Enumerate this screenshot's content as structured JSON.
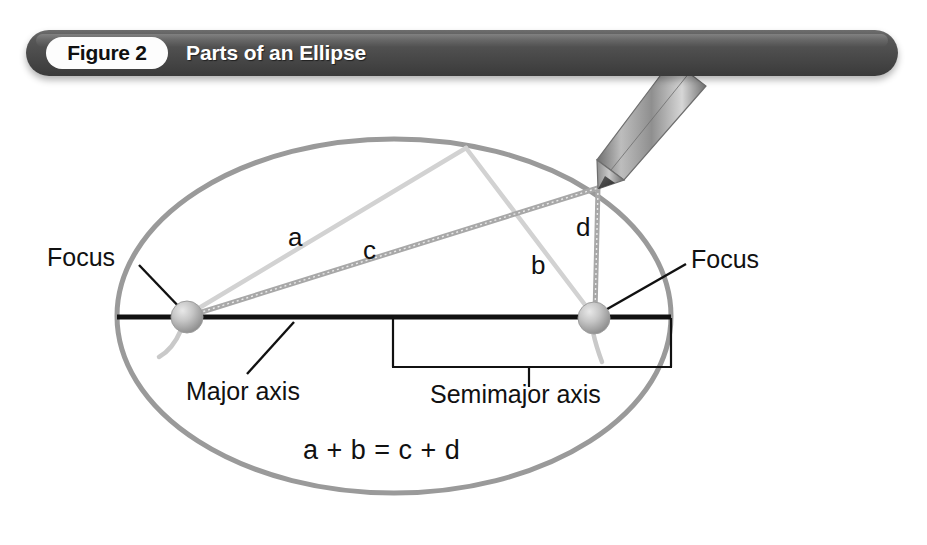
{
  "figure": {
    "number_label": "Figure 2",
    "title": "Parts of an Ellipse",
    "equation": "a + b = c + d"
  },
  "banner": {
    "background_color": "#4a4a4a",
    "pill_color": "#fdfdfd",
    "title_color": "#ffffff",
    "pill_text_color": "#101010"
  },
  "labels": {
    "focus_left": "Focus",
    "focus_right": "Focus",
    "major_axis": "Major axis",
    "semimajor_axis": "Semimajor axis",
    "string_a": "a",
    "string_b": "b",
    "string_c": "c",
    "string_d": "d"
  },
  "colors": {
    "ellipse_outline": "#9a9a9a",
    "major_axis_line": "#111111",
    "leader_line": "#111111",
    "focus_sphere": "#b9b9b9",
    "string_light": "#d4d4d4",
    "string_dark": "#a8a8a8",
    "pencil_body": "#9d9d9d",
    "pencil_tip": "#4d4d4d",
    "bracket": "#111111"
  },
  "geometry": {
    "ellipse_center": [
      394,
      316
    ],
    "ellipse_rx": 277,
    "ellipse_ry": 177,
    "focus_left": [
      187,
      317
    ],
    "focus_right": [
      594,
      318
    ],
    "focus_radius": 16,
    "pencil_tip": [
      598,
      188
    ],
    "string_vertex_ab": [
      466,
      148
    ],
    "major_axis_y": 317,
    "bracket_left_x": 393,
    "bracket_right_x": 671,
    "bracket_bottom_y": 367
  }
}
